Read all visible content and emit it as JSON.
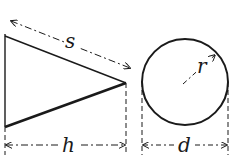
{
  "figure": {
    "type": "geometry-diagram",
    "colors": {
      "stroke": "#1a1a1a",
      "background": "#ffffff"
    },
    "cone_side_view": {
      "shape": "triangle",
      "labels": {
        "slant_height": "s",
        "height": "h"
      }
    },
    "circle_base_view": {
      "shape": "circle",
      "labels": {
        "radius": "r",
        "diameter": "d"
      }
    }
  }
}
